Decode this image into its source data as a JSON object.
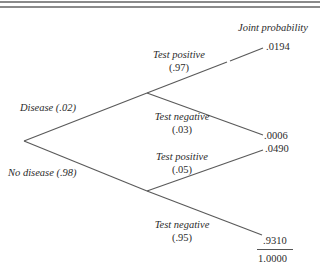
{
  "header": {
    "column_label": "Joint probability"
  },
  "tree": {
    "root": {
      "branches": [
        {
          "label": "Disease (.02)",
          "children": [
            {
              "label": "Test positive",
              "prob": "(.97)",
              "joint": ".0194"
            },
            {
              "label": "Test negative",
              "prob": "(.03)",
              "joint": ".0006"
            }
          ]
        },
        {
          "label": "No disease (.98)",
          "children": [
            {
              "label": "Test positive",
              "prob": "(.05)",
              "joint": ".0490"
            },
            {
              "label": "Test negative",
              "prob": "(.95)",
              "joint": ".9310"
            }
          ]
        }
      ]
    },
    "total": "1.0000"
  },
  "colors": {
    "line": "#5a5a5a",
    "rule": "#8a8a8a",
    "text": "#2b2b2b"
  }
}
